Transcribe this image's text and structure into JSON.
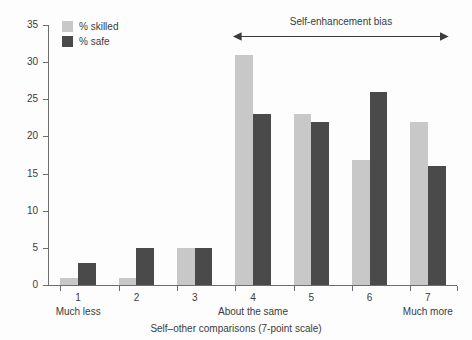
{
  "chart_data": {
    "type": "bar",
    "title": "",
    "subtitle": "",
    "xlabel": "Self–other comparisons (7-point scale)",
    "ylabel": "",
    "categories": [
      "1",
      "2",
      "3",
      "4",
      "5",
      "6",
      "7"
    ],
    "category_sublabels": [
      {
        "category": "1",
        "text": "Much less"
      },
      {
        "category": "4",
        "text": "About the same"
      },
      {
        "category": "7",
        "text": "Much more"
      }
    ],
    "series": [
      {
        "name": "% skilled",
        "color": "#c8c8c8",
        "values": [
          1,
          1,
          5,
          31,
          23,
          16.8,
          22
        ]
      },
      {
        "name": "% safe",
        "color": "#4a4a4a",
        "values": [
          3,
          5,
          5,
          23,
          22,
          26,
          16
        ]
      }
    ],
    "ylim": [
      0,
      35
    ],
    "yticks": [
      0,
      5,
      10,
      15,
      20,
      25,
      30,
      35
    ],
    "ytick_labels": [
      "0",
      "5",
      "10",
      "15",
      "20",
      "25",
      "30",
      "35"
    ],
    "grid": false,
    "legend_position": "top-left",
    "annotations": [
      {
        "text": "Self-enhancement bias",
        "type": "double-arrow",
        "spans_categories": [
          "4",
          "7"
        ]
      }
    ]
  },
  "legend": {
    "items": [
      {
        "label": "% skilled",
        "color": "#c8c8c8"
      },
      {
        "label": "% safe",
        "color": "#4a4a4a"
      }
    ]
  },
  "colors": {
    "skilled": "#c8c8c8",
    "safe": "#4a4a4a",
    "axis": "#6d6d6d",
    "text": "#3b3b3b",
    "background": "#fdfdfd"
  }
}
